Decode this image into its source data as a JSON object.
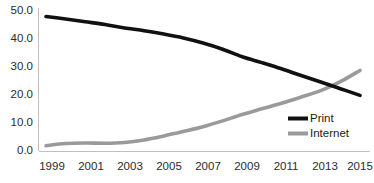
{
  "chart_data": {
    "type": "line",
    "title": "",
    "subtitle": "",
    "xlabel": "",
    "ylabel": "",
    "grid": false,
    "legend_position": "inside-bottom-right",
    "x": [
      1999,
      2000,
      2001,
      2002,
      2003,
      2004,
      2005,
      2006,
      2007,
      2008,
      2009,
      2010,
      2011,
      2012,
      2013,
      2014,
      2015
    ],
    "xlim": [
      1999,
      2015
    ],
    "ylim": [
      0.0,
      50.0
    ],
    "xtick_labels": [
      "1999",
      "2001",
      "2003",
      "2005",
      "2007",
      "2009",
      "2011",
      "2013",
      "2015"
    ],
    "xtick_values": [
      1999,
      2001,
      2003,
      2005,
      2007,
      2009,
      2011,
      2013,
      2015
    ],
    "ytick_labels": [
      "0.0",
      "10.0",
      "20.0",
      "30.0",
      "40.0",
      "50.0"
    ],
    "ytick_values": [
      0.0,
      10.0,
      20.0,
      30.0,
      40.0,
      50.0
    ],
    "series": [
      {
        "name": "Print",
        "color": "#111111",
        "stroke_width": 3.6,
        "values": [
          47.7,
          46.8,
          45.8,
          44.8,
          43.6,
          42.6,
          41.4,
          40.0,
          38.2,
          36.0,
          33.3,
          31.2,
          29.0,
          26.6,
          24.3,
          21.9,
          19.5
        ]
      },
      {
        "name": "Internet",
        "color": "#9a9a9a",
        "stroke_width": 3.6,
        "values": [
          1.5,
          2.3,
          2.5,
          2.4,
          2.7,
          3.6,
          5.0,
          6.6,
          8.3,
          10.4,
          12.7,
          14.7,
          16.7,
          18.9,
          21.2,
          24.4,
          28.4
        ]
      }
    ],
    "legend": [
      {
        "label": "Print",
        "color": "#111111"
      },
      {
        "label": "Internet",
        "color": "#9a9a9a"
      }
    ]
  },
  "axis": {
    "axis_color": "#bfbfbf",
    "tick_text_color": "#2b2b2b"
  },
  "background": "#ffffff"
}
